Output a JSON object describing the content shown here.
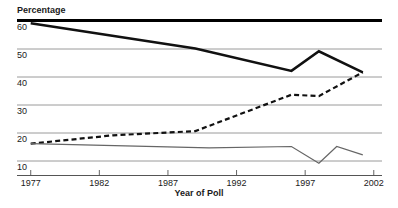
{
  "chart_data": {
    "type": "line",
    "title": "",
    "ylabel": "Percentage",
    "xlabel": "Year of Poll",
    "xlim": [
      1976,
      2002.6
    ],
    "ylim": [
      5,
      62
    ],
    "xticks": [
      1977,
      1982,
      1987,
      1992,
      1997,
      2002
    ],
    "xtick_labels": [
      "1977",
      "1982",
      "1987",
      "1992",
      "1997",
      "2002"
    ],
    "yticks": [
      10,
      20,
      30,
      40,
      50,
      60
    ],
    "ytick_labels": [
      "10",
      "20",
      "30",
      "40",
      "50",
      "60"
    ],
    "grid": "horizontal",
    "legend_position": "none",
    "series": [
      {
        "name": "solid-thick-series",
        "style": "solid",
        "color": "#111111",
        "width": 2.6,
        "x": [
          1977,
          1989,
          1996,
          1998,
          2001.2
        ],
        "values": [
          59,
          50,
          42,
          49,
          41.5
        ]
      },
      {
        "name": "dashed-series",
        "style": "dashed",
        "color": "#111111",
        "width": 2.2,
        "x": [
          1977,
          1983,
          1989,
          1996,
          1998,
          2001.2
        ],
        "values": [
          16,
          19,
          20.5,
          33.5,
          33,
          41.5
        ]
      },
      {
        "name": "thin-gray-series",
        "style": "solid",
        "color": "#666666",
        "width": 1.2,
        "x": [
          1977,
          1990,
          1996,
          1998,
          1999.3,
          2001.2
        ],
        "values": [
          16,
          14.5,
          15,
          9,
          15,
          12
        ]
      }
    ]
  },
  "ylabel_rule": {
    "color": "#000000",
    "thickness": 3
  },
  "colors": {
    "grid": "#808080",
    "axis": "#555555",
    "text": "#1a1a1a",
    "ink": "#111111",
    "gray_series": "#666666"
  }
}
